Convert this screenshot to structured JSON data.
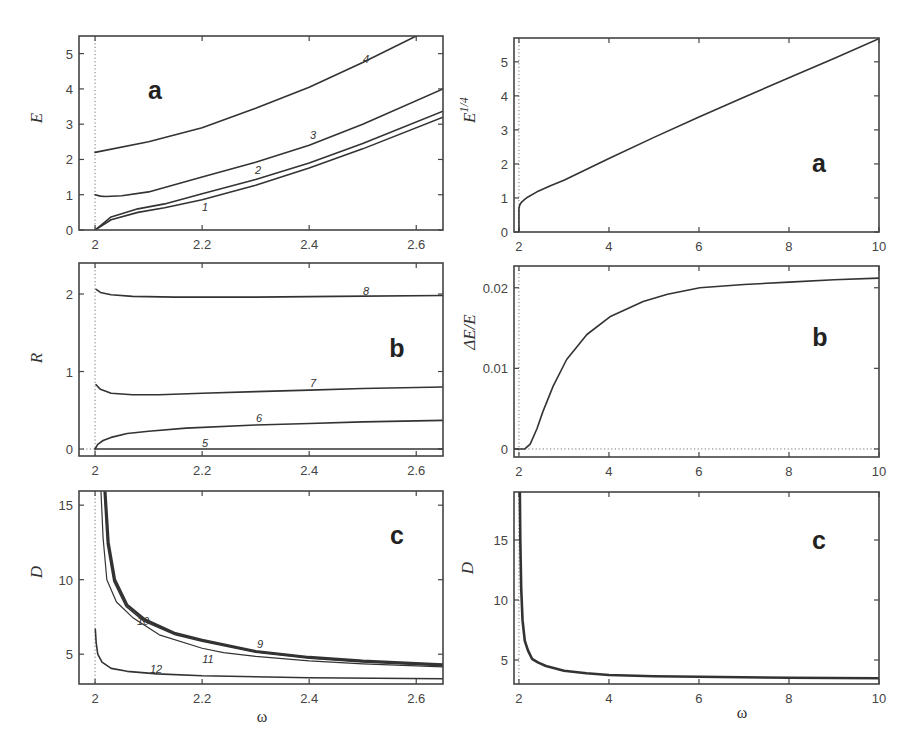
{
  "chart_data": [
    {
      "id": "left-a",
      "type": "line",
      "panel_letter": "a",
      "title": "",
      "xlabel": "",
      "ylabel": "E",
      "xlim": [
        1.97,
        2.65
      ],
      "ylim": [
        0,
        5.5
      ],
      "xticks": [
        2,
        2.2,
        2.4,
        2.6
      ],
      "xtick_labels": [
        "2",
        "2.2",
        "2.4",
        "2.6"
      ],
      "yticks": [
        0,
        1,
        2,
        3,
        4,
        5
      ],
      "ytick_labels": [
        "0",
        "1",
        "2",
        "3",
        "4",
        "5"
      ],
      "grid": false,
      "vline_dotted": 2.0,
      "box": {
        "x": 79,
        "y": 36,
        "w": 364,
        "h": 194
      },
      "letter_pos": [
        155,
        99
      ],
      "ylabel_pos": [
        42,
        118
      ],
      "series": [
        {
          "name": "1",
          "x": [
            2.0,
            2.03,
            2.08,
            2.13,
            2.2,
            2.3,
            2.4,
            2.5,
            2.65
          ],
          "y": [
            0,
            0.29,
            0.5,
            0.63,
            0.86,
            1.27,
            1.76,
            2.3,
            3.2
          ],
          "label_pos": [
            205,
            211
          ]
        },
        {
          "name": "2",
          "x": [
            2.0,
            2.03,
            2.08,
            2.13,
            2.2,
            2.3,
            2.4,
            2.5,
            2.65
          ],
          "y": [
            0,
            0.37,
            0.6,
            0.74,
            1.03,
            1.43,
            1.9,
            2.45,
            3.37
          ],
          "label_pos": [
            258,
            174
          ]
        },
        {
          "name": "3",
          "x": [
            2.0,
            2.01,
            2.02,
            2.05,
            2.1,
            2.2,
            2.3,
            2.4,
            2.5,
            2.65
          ],
          "y": [
            1.0,
            0.96,
            0.95,
            0.97,
            1.08,
            1.5,
            1.92,
            2.4,
            3.0,
            4.0
          ],
          "label_pos": [
            313,
            139
          ]
        },
        {
          "name": "4",
          "x": [
            2.0,
            2.1,
            2.2,
            2.3,
            2.4,
            2.5,
            2.6
          ],
          "y": [
            2.2,
            2.5,
            2.9,
            3.45,
            4.05,
            4.75,
            5.5
          ],
          "label_pos": [
            366,
            63
          ]
        }
      ]
    },
    {
      "id": "left-b",
      "type": "line",
      "panel_letter": "b",
      "title": "",
      "xlabel": "",
      "ylabel": "R",
      "xlim": [
        1.97,
        2.65
      ],
      "ylim": [
        -0.09,
        2.4
      ],
      "xticks": [
        2,
        2.2,
        2.4,
        2.6
      ],
      "xtick_labels": [
        "2",
        "2.2",
        "2.4",
        "2.6"
      ],
      "yticks": [
        0,
        1,
        2
      ],
      "ytick_labels": [
        "0",
        "1",
        "2"
      ],
      "grid": false,
      "vline_dotted": 2.0,
      "hline_dotted_left": 0,
      "box": {
        "x": 79,
        "y": 263,
        "w": 364,
        "h": 193
      },
      "letter_pos": [
        397,
        357
      ],
      "ylabel_pos": [
        42,
        358
      ],
      "series": [
        {
          "name": "5",
          "x": [
            2.0,
            2.65
          ],
          "y": [
            0,
            0
          ],
          "label_pos": [
            205,
            447
          ]
        },
        {
          "name": "6",
          "x": [
            2.0,
            2.005,
            2.015,
            2.03,
            2.06,
            2.1,
            2.17,
            2.3,
            2.4,
            2.5,
            2.65
          ],
          "y": [
            0,
            0.06,
            0.11,
            0.15,
            0.2,
            0.23,
            0.27,
            0.31,
            0.33,
            0.35,
            0.37
          ],
          "label_pos": [
            259,
            422
          ]
        },
        {
          "name": "7",
          "x": [
            2.002,
            2.01,
            2.03,
            2.07,
            2.12,
            2.2,
            2.3,
            2.4,
            2.5,
            2.65
          ],
          "y": [
            0.83,
            0.77,
            0.72,
            0.7,
            0.7,
            0.72,
            0.74,
            0.76,
            0.78,
            0.8
          ],
          "label_pos": [
            313,
            387
          ]
        },
        {
          "name": "8",
          "x": [
            2.002,
            2.01,
            2.03,
            2.07,
            2.15,
            2.3,
            2.45,
            2.65
          ],
          "y": [
            2.06,
            2.02,
            1.99,
            1.97,
            1.96,
            1.96,
            1.97,
            1.98
          ],
          "label_pos": [
            366,
            295
          ]
        }
      ]
    },
    {
      "id": "left-c",
      "type": "line",
      "panel_letter": "c",
      "title": "",
      "xlabel": "ω",
      "ylabel": "D",
      "xlim": [
        1.97,
        2.65
      ],
      "ylim": [
        3.0,
        15.95
      ],
      "xticks": [
        2,
        2.2,
        2.4,
        2.6
      ],
      "xtick_labels": [
        "2",
        "2.2",
        "2.4",
        "2.6"
      ],
      "yticks": [
        5,
        10,
        15
      ],
      "ytick_labels": [
        "5",
        "10",
        "15"
      ],
      "grid": false,
      "vline_dotted": 2.0,
      "box": {
        "x": 79,
        "y": 491,
        "w": 364,
        "h": 193
      },
      "letter_pos": [
        397,
        544
      ],
      "ylabel_pos": [
        42,
        572
      ],
      "xlabel_pos": [
        262,
        722
      ],
      "series": [
        {
          "name": "9",
          "style": "thick",
          "x": [
            2.019,
            2.025,
            2.037,
            2.06,
            2.093,
            2.15,
            2.2,
            2.3,
            2.4,
            2.5,
            2.65
          ],
          "y": [
            15.95,
            12.5,
            10.0,
            8.3,
            7.33,
            6.4,
            5.95,
            5.2,
            4.8,
            4.55,
            4.3
          ],
          "label_pos": [
            260,
            648
          ]
        },
        {
          "name": "10",
          "style": "normal",
          "x": [
            2.017,
            2.023,
            2.035,
            2.058,
            2.09,
            2.15,
            2.2,
            2.3,
            2.4,
            2.5,
            2.65
          ],
          "y": [
            15.95,
            12.4,
            9.9,
            8.2,
            7.25,
            6.3,
            5.87,
            5.13,
            4.73,
            4.48,
            4.22
          ],
          "label_pos": [
            143,
            625
          ]
        },
        {
          "name": "11",
          "style": "thin",
          "x": [
            2.011,
            2.015,
            2.022,
            2.04,
            2.07,
            2.12,
            2.2,
            2.24,
            2.3,
            2.4,
            2.5,
            2.65
          ],
          "y": [
            15.95,
            12.8,
            10.0,
            8.5,
            7.47,
            6.3,
            5.4,
            5.1,
            4.85,
            4.55,
            4.35,
            4.15
          ],
          "label_pos": [
            208,
            663
          ]
        },
        {
          "name": "12",
          "style": "normal",
          "x": [
            2.0005,
            2.002,
            2.005,
            2.013,
            2.03,
            2.06,
            2.116,
            2.2,
            2.4,
            2.65
          ],
          "y": [
            6.67,
            5.8,
            5.0,
            4.47,
            4.05,
            3.85,
            3.68,
            3.55,
            3.42,
            3.35
          ],
          "label_pos": [
            156,
            673
          ]
        }
      ]
    },
    {
      "id": "right-a",
      "type": "line",
      "panel_letter": "a",
      "title": "",
      "xlabel": "",
      "ylabel": "E^{1/4}",
      "ylabel_main": "E",
      "ylabel_sup": "1/4",
      "xlim": [
        1.89,
        10
      ],
      "ylim": [
        0,
        5.7
      ],
      "xticks": [
        2,
        4,
        6,
        8,
        10
      ],
      "xtick_labels": [
        "2",
        "4",
        "6",
        "8",
        "10"
      ],
      "yticks": [
        0,
        1,
        2,
        3,
        4,
        5
      ],
      "ytick_labels": [
        "0",
        "1",
        "2",
        "3",
        "4",
        "5"
      ],
      "grid": false,
      "vline_dotted": 2.0,
      "box": {
        "x": 514,
        "y": 38,
        "w": 365,
        "h": 194
      },
      "letter_pos": [
        819,
        172
      ],
      "ylabel_pos": [
        475,
        110
      ],
      "series": [
        {
          "name": "E^{1/4}",
          "x": [
            2.0,
            2.0,
            2.02,
            2.06,
            2.12,
            2.2,
            2.4,
            2.7,
            3.0,
            4.0,
            5.0,
            6.0,
            7.0,
            8.0,
            9.0,
            10.0
          ],
          "y": [
            0,
            0.7,
            0.8,
            0.88,
            0.95,
            1.03,
            1.18,
            1.36,
            1.52,
            2.16,
            2.78,
            3.38,
            3.96,
            4.53,
            5.1,
            5.68
          ]
        }
      ]
    },
    {
      "id": "right-b",
      "type": "line",
      "panel_letter": "b",
      "title": "",
      "xlabel": "",
      "ylabel": "ΔE/E",
      "xlim": [
        1.89,
        10
      ],
      "ylim": [
        -0.001,
        0.0227
      ],
      "xticks": [
        2,
        4,
        6,
        8,
        10
      ],
      "xtick_labels": [
        "2",
        "4",
        "6",
        "8",
        "10"
      ],
      "yticks": [
        0,
        0.01,
        0.02
      ],
      "ytick_labels": [
        "0",
        "0.01",
        "0.02"
      ],
      "grid": false,
      "vline_dotted": 2.0,
      "hline_dotted": 0,
      "box": {
        "x": 514,
        "y": 266,
        "w": 365,
        "h": 191
      },
      "letter_pos": [
        820,
        346
      ],
      "ylabel_pos": [
        475,
        332
      ],
      "series": [
        {
          "name": "ΔE/E",
          "x": [
            1.89,
            2.13,
            2.25,
            2.4,
            2.53,
            2.76,
            3.06,
            3.51,
            4.02,
            4.76,
            5.3,
            6.02,
            7.0,
            8.0,
            9.0,
            10.0
          ],
          "y": [
            0,
            0,
            0.0006,
            0.0025,
            0.0046,
            0.0078,
            0.0111,
            0.0142,
            0.0164,
            0.0183,
            0.0192,
            0.02,
            0.0204,
            0.0207,
            0.021,
            0.0212
          ]
        }
      ]
    },
    {
      "id": "right-c",
      "type": "line",
      "panel_letter": "c",
      "title": "",
      "xlabel": "ω",
      "ylabel": "D",
      "xlim": [
        1.89,
        10
      ],
      "ylim": [
        3.0,
        19.0
      ],
      "xticks": [
        2,
        4,
        6,
        8,
        10
      ],
      "xtick_labels": [
        "2",
        "4",
        "6",
        "8",
        "10"
      ],
      "yticks": [
        5,
        10,
        15
      ],
      "ytick_labels": [
        "5",
        "10",
        "15"
      ],
      "grid": false,
      "vline_dotted": 2.0,
      "box": {
        "x": 514,
        "y": 492,
        "w": 365,
        "h": 192
      },
      "letter_pos": [
        819,
        549
      ],
      "ylabel_pos": [
        473,
        568
      ],
      "xlabel_pos": [
        742,
        718
      ],
      "series": [
        {
          "name": "D",
          "style": "thick",
          "x": [
            2.02,
            2.03,
            2.05,
            2.08,
            2.13,
            2.2,
            2.29,
            2.42,
            2.6,
            3.0,
            3.5,
            4.0,
            5.0,
            6.0,
            8.0,
            10.0
          ],
          "y": [
            19.0,
            15.0,
            11.0,
            8.3,
            6.6,
            5.8,
            5.1,
            4.8,
            4.5,
            4.1,
            3.9,
            3.75,
            3.65,
            3.6,
            3.52,
            3.48
          ]
        }
      ]
    }
  ]
}
